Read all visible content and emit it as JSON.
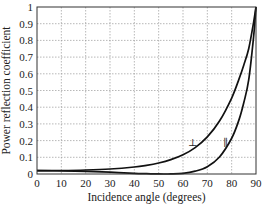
{
  "chart_data": {
    "type": "line",
    "title": "",
    "xlabel": "Incidence angle (degrees)",
    "ylabel": "Power reflection coefficient",
    "xlim": [
      0,
      90
    ],
    "ylim": [
      0,
      1
    ],
    "grid": true,
    "xticks": [
      "0",
      "10",
      "20",
      "30",
      "40",
      "50",
      "60",
      "70",
      "80",
      "90"
    ],
    "yticks": [
      "0",
      "0.1",
      "0.2",
      "0.3",
      "0.4",
      "0.5",
      "0.6",
      "0.7",
      "0.8",
      "0.9",
      "1"
    ],
    "series": [
      {
        "name": "perpendicular",
        "label": "⊥",
        "label_at": [
          64,
          0.19
        ],
        "x": [
          0,
          10,
          20,
          30,
          40,
          45,
          50,
          55,
          60,
          65,
          70,
          75,
          80,
          83,
          85,
          87,
          89,
          90
        ],
        "y": [
          0.02,
          0.021,
          0.024,
          0.03,
          0.042,
          0.052,
          0.066,
          0.086,
          0.115,
          0.158,
          0.222,
          0.317,
          0.455,
          0.568,
          0.653,
          0.75,
          0.907,
          1.0
        ]
      },
      {
        "name": "parallel",
        "label": "∥",
        "label_at": [
          77.5,
          0.19
        ],
        "x": [
          0,
          10,
          20,
          30,
          40,
          45,
          50,
          53,
          55,
          60,
          65,
          70,
          75,
          80,
          83,
          85,
          87,
          89,
          90
        ],
        "y": [
          0.02,
          0.019,
          0.016,
          0.011,
          0.004,
          0.002,
          0.0002,
          0.0,
          0.0003,
          0.004,
          0.017,
          0.044,
          0.102,
          0.214,
          0.324,
          0.428,
          0.563,
          0.82,
          1.0
        ]
      }
    ]
  }
}
